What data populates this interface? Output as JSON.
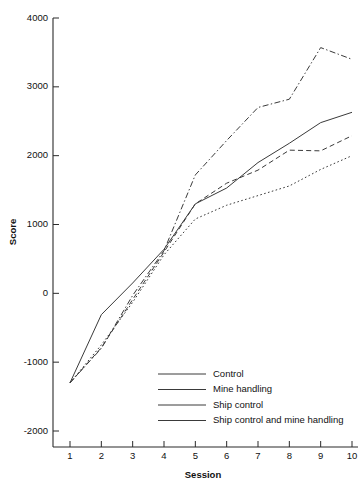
{
  "chart_data": {
    "type": "line",
    "title": "",
    "xlabel": "Session",
    "ylabel": "Score",
    "x": [
      1,
      2,
      3,
      4,
      5,
      6,
      7,
      8,
      9,
      10
    ],
    "xtick_labels": [
      "1",
      "2",
      "3",
      "4",
      "5",
      "6",
      "7",
      "8",
      "9",
      "10"
    ],
    "ytick_labels": [
      "4000",
      "3000",
      "2000",
      "1000",
      "0",
      "-1000",
      "-2000"
    ],
    "ytick_values": [
      4000,
      3000,
      2000,
      1000,
      0,
      -1000,
      -2000
    ],
    "xlim": [
      0.6,
      10.4
    ],
    "ylim": [
      -2000,
      4000
    ],
    "grid": false,
    "legend_position": "bottom-center",
    "series": [
      {
        "name": "Control",
        "style": "dotted",
        "values": [
          -1300,
          -750,
          -130,
          560,
          1080,
          1280,
          1420,
          1560,
          1800,
          2000
        ]
      },
      {
        "name": "Mine handling",
        "style": "dashed",
        "values": [
          -1300,
          -790,
          -90,
          600,
          1300,
          1600,
          1790,
          2080,
          2070,
          2290
        ]
      },
      {
        "name": "Ship control",
        "style": "solid",
        "values": [
          -1300,
          -310,
          150,
          640,
          1300,
          1530,
          1900,
          2180,
          2480,
          2630
        ]
      },
      {
        "name": "Ship control and mine handling",
        "style": "dash-dot",
        "values": [
          -1300,
          -800,
          -30,
          620,
          1720,
          2220,
          2700,
          2820,
          3570,
          3400
        ]
      }
    ]
  },
  "legend": {
    "items": [
      {
        "label": "Control",
        "style": "dotted"
      },
      {
        "label": "Mine handling",
        "style": "dashed"
      },
      {
        "label": "Ship control",
        "style": "solid"
      },
      {
        "label": "Ship control and mine handling",
        "style": "dash-dot"
      }
    ]
  }
}
